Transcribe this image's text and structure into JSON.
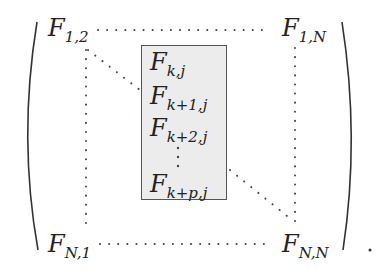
{
  "matrix": {
    "corners": {
      "top_left": {
        "base": "F",
        "sub": "1,2"
      },
      "top_right": {
        "base": "F",
        "sub": "1,N"
      },
      "bottom_left": {
        "base": "F",
        "sub": "N,1"
      },
      "bottom_right": {
        "base": "F",
        "sub": "N,N"
      }
    },
    "box_entries": [
      {
        "base": "F",
        "sub": "k,j"
      },
      {
        "base": "F",
        "sub": "k+1,j"
      },
      {
        "base": "F",
        "sub": "k+2,j"
      },
      {
        "base": "F",
        "sub": "k+p,j"
      }
    ],
    "box_fill": "#ececec",
    "trailing_punct": "."
  }
}
